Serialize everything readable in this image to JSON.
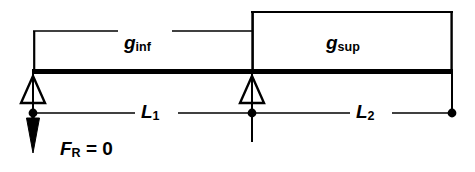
{
  "diagram": {
    "type": "structural-beam-load-diagram",
    "background_color": "#ffffff",
    "stroke_color": "#000000",
    "labels": {
      "load_lower": {
        "symbol": "g",
        "subscript": "inf",
        "full": "g_inf"
      },
      "load_upper": {
        "symbol": "g",
        "subscript": "sup",
        "full": "g_sup"
      },
      "span_left": {
        "symbol": "L",
        "subscript": "1",
        "full": "L_1"
      },
      "span_right": {
        "symbol": "L",
        "subscript": "2",
        "full": "L_2"
      },
      "reaction_force": {
        "symbol": "F",
        "subscript": "R",
        "equals": "= 0",
        "full": "F_R = 0"
      }
    },
    "supports": [
      {
        "name": "left-support",
        "style": "hollow-triangle-pinned",
        "x": 33,
        "y": 73
      },
      {
        "name": "middle-support",
        "style": "hollow-triangle-pinned",
        "x": 252,
        "y": 73
      }
    ],
    "beam": {
      "x_start": 33,
      "x_end": 452,
      "y": 71,
      "thickness": 5
    },
    "load_blocks": [
      {
        "name": "g-inf-block",
        "x_start": 33,
        "x_end": 252,
        "top_y": 31
      },
      {
        "name": "g-sup-block",
        "x_start": 252,
        "x_end": 452,
        "top_y": 11
      }
    ],
    "dimension_line": {
      "y": 113,
      "nodes_x": [
        33,
        252,
        452
      ]
    },
    "force_arrow": {
      "name": "downward-reaction-arrow",
      "x": 33,
      "y_start": 112,
      "y_end": 152,
      "direction": "down",
      "fill": "solid"
    }
  }
}
